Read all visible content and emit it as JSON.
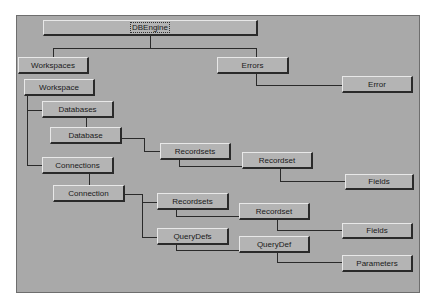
{
  "diagram": {
    "type": "object-hierarchy",
    "colors": {
      "background": "#a9a9a9",
      "node": "#b4b4b4",
      "line": "#2a2a2a"
    },
    "nodes": [
      {
        "id": "dbengine",
        "label": "DBEngine"
      },
      {
        "id": "workspaces",
        "label": "Workspaces"
      },
      {
        "id": "workspace",
        "label": "Workspace"
      },
      {
        "id": "errors",
        "label": "Errors"
      },
      {
        "id": "error",
        "label": "Error"
      },
      {
        "id": "databases",
        "label": "Databases"
      },
      {
        "id": "database",
        "label": "Database"
      },
      {
        "id": "recordsets1",
        "label": "Recordsets"
      },
      {
        "id": "recordset1",
        "label": "Recordset"
      },
      {
        "id": "fields1",
        "label": "Fields"
      },
      {
        "id": "connections",
        "label": "Connections"
      },
      {
        "id": "connection",
        "label": "Connection"
      },
      {
        "id": "recordsets2",
        "label": "Recordsets"
      },
      {
        "id": "recordset2",
        "label": "Recordset"
      },
      {
        "id": "fields2",
        "label": "Fields"
      },
      {
        "id": "querydefs",
        "label": "QueryDefs"
      },
      {
        "id": "querydef",
        "label": "QueryDef"
      },
      {
        "id": "parameters",
        "label": "Parameters"
      }
    ],
    "edges": [
      [
        "dbengine",
        "workspaces"
      ],
      [
        "dbengine",
        "errors"
      ],
      [
        "workspaces",
        "workspace"
      ],
      [
        "errors",
        "error"
      ],
      [
        "workspace",
        "databases"
      ],
      [
        "databases",
        "database"
      ],
      [
        "database",
        "recordsets1"
      ],
      [
        "recordsets1",
        "recordset1"
      ],
      [
        "recordset1",
        "fields1"
      ],
      [
        "workspace",
        "connections"
      ],
      [
        "connections",
        "connection"
      ],
      [
        "connection",
        "recordsets2"
      ],
      [
        "connection",
        "querydefs"
      ],
      [
        "recordsets2",
        "recordset2"
      ],
      [
        "recordset2",
        "fields2"
      ],
      [
        "querydefs",
        "querydef"
      ],
      [
        "querydef",
        "parameters"
      ]
    ]
  }
}
